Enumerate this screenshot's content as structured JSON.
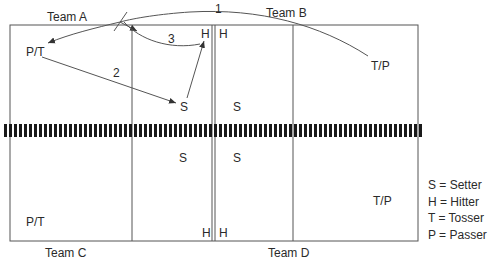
{
  "diagram": {
    "type": "volleyball-court-drill",
    "teams": {
      "a": "Team A",
      "b": "Team B",
      "c": "Team C",
      "d": "Team D"
    },
    "players": {
      "team_a": {
        "pt": "P/T",
        "s": "S",
        "h": "H"
      },
      "team_b": {
        "h": "H",
        "s": "S",
        "tp": "T/P"
      },
      "team_c": {
        "s": "S",
        "h": "H",
        "pt": "P/T"
      },
      "team_d": {
        "s": "S",
        "h": "H",
        "tp": "T/P"
      }
    },
    "steps": {
      "one": "1",
      "two": "2",
      "three": "3"
    },
    "legend": [
      {
        "label": "S = Setter"
      },
      {
        "label": "H = Hitter"
      },
      {
        "label": "T = Tosser"
      },
      {
        "label": "P = Passer"
      }
    ],
    "colors": {
      "line": "#555555",
      "net": "#1a1a1a",
      "text": "#2a2a2a"
    }
  }
}
